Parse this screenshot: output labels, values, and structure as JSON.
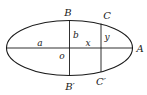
{
  "diagram": {
    "type": "ellipse-geometry",
    "stroke_color": "#1a1a1a",
    "background": "#ffffff",
    "ellipse": {
      "cx": 69.5,
      "cy": 48,
      "rx": 63,
      "ry": 27.5
    },
    "labels": {
      "B": "B",
      "B_prime": "B′",
      "C": "C",
      "C_prime": "C′",
      "A": "A",
      "a": "a",
      "b": "b",
      "o": "o",
      "x": "x",
      "y": "y"
    }
  }
}
